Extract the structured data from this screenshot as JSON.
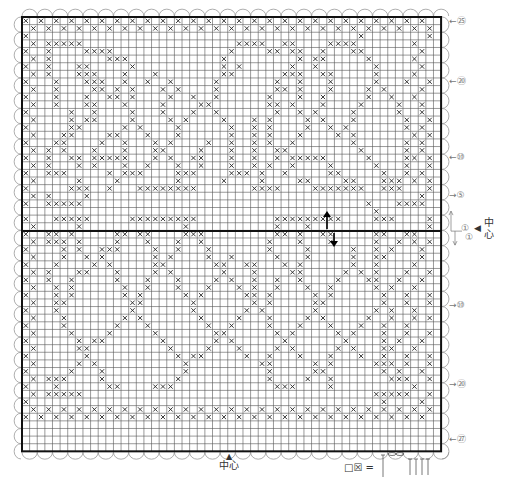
{
  "chart": {
    "grid": {
      "left": 22,
      "top": 17,
      "cols": 55,
      "rows": 57,
      "cell": 7.62,
      "center_row": 29
    },
    "border_color": "#111111",
    "grid_color": "#555555",
    "mark_symbol": "×",
    "rows_top": [
      "x.x.x.x.x.x.x.x.x.x.x.x.x.x.x.x.x.x.x.x.x.x.x.x.x.x.x.",
      ".x.x.x.x.x.x.x.x.x.x.x.x.x.x.x.x.x.x.x.x.x.x.x.x.x.x.x",
      "x...........................................x........x.",
      ".x.xxxxx....................xxxx..xx....xxxx.......x..",
      "x..x....xxxx...............x....xx.xx..x...xx.......x.",
      ".x.x.......xxx............x.........x.xx.....x.....x..",
      "x..x...xx.....x...........x.x......x..x.......x.....x.",
      ".x.x...xxx...x...x........xx......xxx..xx.....x....x..",
      "x...x...xxx..x..x..x.....x.......x..x...x.....x...x..x",
      ".x..x....xx.x.x...x.x....x.......xx.x...x....x.x....x.",
      "x...x...x..xx.x....x..x..x......x...x..x.....x..x..x..",
      ".x..x...xx...x....x....xx.......xx.x...x....x....x..x.",
      "x.....x..x....x...x...x..x.......x..x.x....x.....x..x.",
      ".x....x.xx....x....x.x....x...x.x....x.x...x......x..x",
      "x.....xx.....x.x....x......x..x.x....x..x.x.......x.x.",
      ".x...xx....xx...x...x......x..x.x...x....x.x.......x.x",
      "x...xx....x..x...x.x....x..x..x.x..x.......x......x.x.",
      ".x.x.x...x...x...xx....x...x..x..xx.........x.....x.x.",
      "x..x..xx.xxxxx...x.x..xx...x..x..x.xxxxx.....x....xx.x",
      ".x.x...x.x...x..x...x..x...x..x.x..x....x.....x...x..x",
      "x..xxx.....x.xxx....xxx....xxx.x..x.....xx.....x..x.x.",
      ".x.....x....x.......x.....x....x....xx....xx...xxx.x.x",
      "x.....xxx..x...xxxxxxxx.......xxxx....xxxxxxx..xxx...x",
      ".x.x....x...........................................x.",
      "x..xxxxx.....................................x...xxxx1",
      "..............................................x......."
    ],
    "rows_bottom": [
      "x...xxxxx.....xxxxxxxxx..........xxxxxxxxx....xxx....x",
      ".x.....x.............x...........x...x...............x.",
      "x..xx.x.....xx.xx....xxx.........xx.x..xx.....xx..xx..",
      ".x.xxx.x....x...x...x..x........x...x...x.....x..x.x.x",
      "x....x.x..xxx....x..x...x.......x....x.....x..x.x...x.",
      ".x...x..x.x......x.x....x..x.....x...x.....x..xx....x.",
      "x...x....x.x.....xx......xx..xx...x.x......x..x....x..",
      ".x.x...xx...x....x.x......x...x....xx.....x.x.x...x..x",
      "x..x..x.....x...x...x....x.x..x..x..x....x...xx..x..x.",
      ".x..x.x......x..x...x...x...x.x..x...x..x.....x.x..x..",
      "x...x.x......x.x.....x.x.....xx.x.....x.x......x..x..x",
      ".x..xx........xx......x.......x.x.....xx.......x..x..x.",
      "x...x.........x.......x......x.x......x.......x.x..x..",
      ".x...x.......x.x.......x....x...x....x.x.....x..x..x.x",
      "x....x......x...x.......x..x....x...x...x...x..x..x...",
      ".x....x....x.....x.......xx......x.x.....x.x...x..x..x",
      "x......x.xx.......x......x.x......x.......x....x.x..x.",
      ".x.....xx..........x....x...x....x.x.....x.x...xx..x..",
      "x.......x...........x.xx.....x..x...x...x...x..x..x..x",
      ".x.....x.x...........x.........xx.....x.x.....xxx.x..x.",
      "x.....x...x..........x..........x.....xx.......x.x..x.",
      ".x.xxx....x.........x...........x....x..x.......xxx..x",
      "x...x......xx....xxx.............xxx....x..........x..",
      ".x.xxxxx......................................xxxxx..x.",
      "x..............................................x....x.",
      ".x.x.x.x.x.x.x.x.x.x.x.x.x.x.x.x.x.x.x.x.x.x.x.x.x.x.x",
      "x.x.x.x.x.x.x.x.x.x.x.x.x.x.x.x.x.x.x.x.x.x.x.x.x.x.x."
    ],
    "side_labels": [
      {
        "text": "←㉕",
        "y": 20
      },
      {
        "text": "←⑳",
        "y": 80
      },
      {
        "text": "←⑩",
        "y": 158
      },
      {
        "text": "→⑤",
        "y": 196
      },
      {
        "text": "→⑩",
        "y": 306
      },
      {
        "text": "→⑳",
        "y": 383
      },
      {
        "text": "←㉗",
        "y": 438
      }
    ],
    "center_right": {
      "arrow": "◀",
      "text1": "中",
      "text2": "心",
      "row_up": "①",
      "row_down": "①"
    },
    "center_bottom": {
      "arrow": "▲",
      "text": "中心"
    },
    "legend": {
      "symbols": "□☒ =",
      "note": "stitch key"
    }
  }
}
